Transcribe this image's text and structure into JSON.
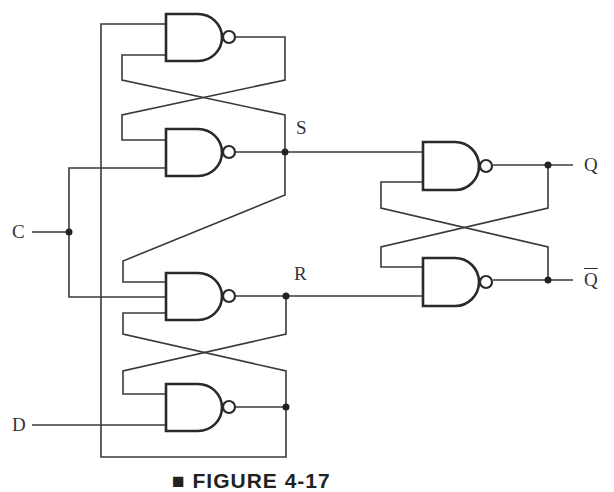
{
  "diagram": {
    "type": "logic-circuit",
    "labels": {
      "clock_input": "C",
      "data_input": "D",
      "set_node": "S",
      "reset_node": "R",
      "output_q": "Q",
      "output_q_bar": "Q"
    },
    "caption": "■ FIGURE 4-17",
    "gates": [
      {
        "id": "g1",
        "kind": "NAND",
        "position": "top-left"
      },
      {
        "id": "g2",
        "kind": "NAND",
        "position": "upper-middle-left",
        "output": "S"
      },
      {
        "id": "g3",
        "kind": "NAND",
        "position": "lower-middle-left",
        "output": "R"
      },
      {
        "id": "g4",
        "kind": "NAND",
        "position": "bottom-left"
      },
      {
        "id": "g5",
        "kind": "NAND",
        "position": "right-top",
        "output": "Q"
      },
      {
        "id": "g6",
        "kind": "NAND",
        "position": "right-bottom",
        "output": "Q-bar"
      }
    ],
    "colors": {
      "line": "#3a3a3a",
      "background": "#ffffff"
    }
  }
}
